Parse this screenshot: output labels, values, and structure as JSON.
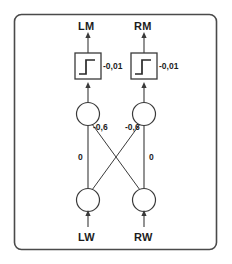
{
  "diagram": {
    "type": "neural-network",
    "frame": {
      "color": "#4a4a4a"
    },
    "outputs": [
      {
        "id": "lm",
        "label": "LM"
      },
      {
        "id": "rm",
        "label": "RM"
      }
    ],
    "inputs": [
      {
        "id": "lw",
        "label": "LW"
      },
      {
        "id": "rw",
        "label": "RW"
      }
    ],
    "activation_boxes": [
      {
        "id": "act-left",
        "glyph": "step-function-icon",
        "bias_label": "-0,01"
      },
      {
        "id": "act-right",
        "glyph": "step-function-icon",
        "bias_label": "-0,01"
      }
    ],
    "weights": {
      "left_to_left": "0",
      "right_to_right": "0",
      "left_cross": "-0,6",
      "right_cross": "-0,6"
    },
    "weight_labels": [
      {
        "id": "w-lm-cross",
        "text": "-0,6"
      },
      {
        "id": "w-rm-cross",
        "text": "-0,6"
      },
      {
        "id": "w-left-direct",
        "text": "0"
      },
      {
        "id": "w-right-direct",
        "text": "0"
      }
    ]
  }
}
